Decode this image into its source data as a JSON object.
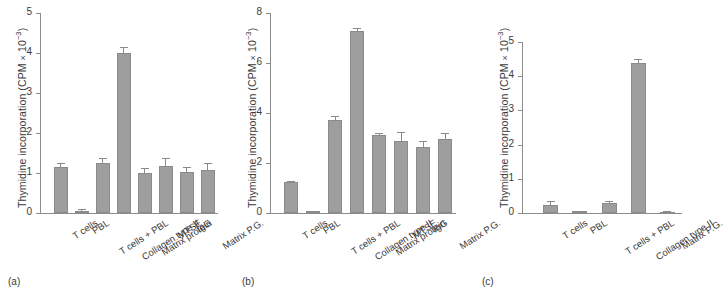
{
  "figure": {
    "ylabel_main": "Thymidine incorporation (CPM",
    "ylabel_times": "×",
    "ylabel_unit": "10",
    "ylabel_exp": "−3",
    "ylabel_close": ")"
  },
  "panels": [
    {
      "caption": "(a)"
    },
    {
      "caption": "(b)"
    },
    {
      "caption": "(c)"
    }
  ],
  "chart_data": [
    {
      "type": "bar",
      "panel": "(a)",
      "title": "",
      "xlabel": "",
      "ylabel": "Thymidine incorporation (CPM × 10⁻³)",
      "ylim": [
        0,
        5
      ],
      "yticks": [
        0,
        1,
        2,
        3,
        4,
        5
      ],
      "ytick_labels": [
        "0",
        "1",
        "2",
        "3",
        "4",
        "5"
      ],
      "grid": false,
      "legend": "none",
      "categories": [
        "T cells",
        "PBL",
        "T cells + PBL",
        "Collagen type II",
        "Matrix protein",
        "MTSE",
        "IgG",
        "Matrix P.G."
      ],
      "values": [
        1.15,
        0.06,
        1.26,
        4.0,
        0.99,
        1.18,
        1.02,
        1.08
      ],
      "errors": [
        0.1,
        0.03,
        0.11,
        0.16,
        0.13,
        0.2,
        0.13,
        0.18
      ]
    },
    {
      "type": "bar",
      "panel": "(b)",
      "title": "",
      "xlabel": "",
      "ylabel": "Thymidine incorporation (CPM × 10⁻³)",
      "ylim": [
        0,
        8
      ],
      "yticks": [
        0,
        2,
        4,
        6,
        8
      ],
      "ytick_labels": [
        "0",
        "2",
        "4",
        "6",
        "8"
      ],
      "grid": false,
      "legend": "none",
      "categories": [
        "T cells",
        "PBL",
        "T cells + PBL",
        "Collagen type II",
        "Matrix protein",
        "MTSE",
        "IgG",
        "Matrix P.G."
      ],
      "values": [
        1.24,
        0.07,
        3.74,
        7.28,
        3.13,
        2.9,
        2.65,
        2.98
      ],
      "errors": [
        0.06,
        0.03,
        0.16,
        0.14,
        0.08,
        0.35,
        0.22,
        0.24
      ]
    },
    {
      "type": "bar",
      "panel": "(c)",
      "title": "",
      "xlabel": "",
      "ylabel": "Thymidine incorporation (CPM × 10⁻³)",
      "ylim": [
        0,
        5
      ],
      "yticks": [
        0,
        1,
        2,
        3,
        4,
        5
      ],
      "ytick_labels": [
        "0",
        "1",
        "2",
        "3",
        "4",
        "5"
      ],
      "grid": false,
      "legend": "none",
      "categories": [
        "T cells",
        "PBL",
        "T cells + PBL",
        "Collagen type II",
        "Matrix P.G."
      ],
      "values": [
        0.22,
        0.05,
        0.28,
        4.4,
        0.03
      ],
      "errors": [
        0.12,
        0.02,
        0.06,
        0.09,
        0.02
      ]
    }
  ]
}
